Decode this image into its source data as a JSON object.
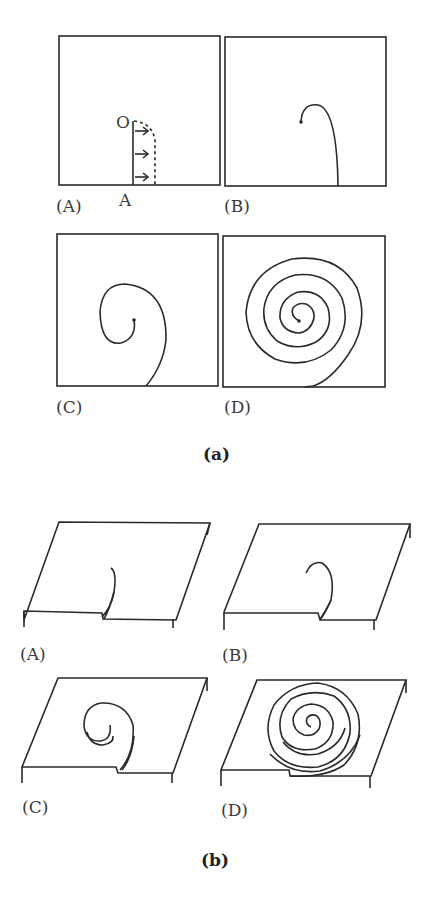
{
  "figure": {
    "part_a": {
      "caption": "(a)",
      "panels": [
        {
          "label": "(A)",
          "point_o": "O",
          "point_a": "A"
        },
        {
          "label": "(B)"
        },
        {
          "label": "(C)"
        },
        {
          "label": "(D)"
        }
      ]
    },
    "part_b": {
      "caption": "(b)",
      "panels": [
        {
          "label": "(A)"
        },
        {
          "label": "(B)"
        },
        {
          "label": "(C)"
        },
        {
          "label": "(D)"
        }
      ]
    }
  }
}
